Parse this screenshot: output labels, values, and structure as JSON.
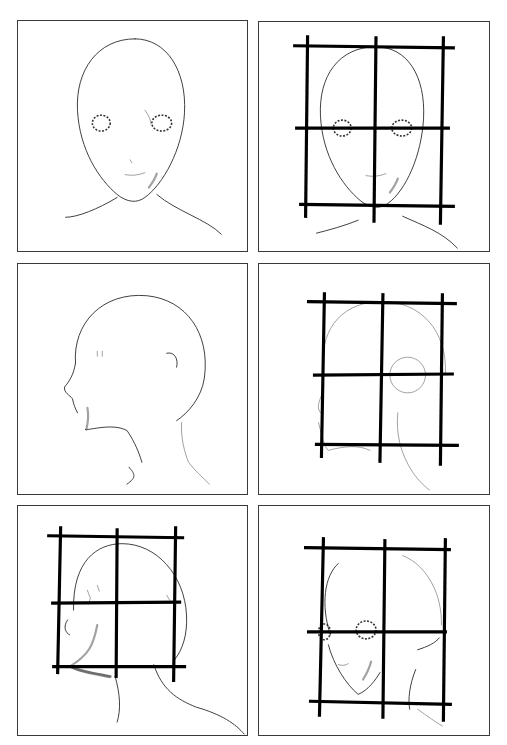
{
  "panels": [
    {
      "id": "front-view",
      "view": "front",
      "grid": false,
      "position": "row1-left"
    },
    {
      "id": "front-view-grid",
      "view": "front",
      "grid": true,
      "grid_lines": {
        "vertical": 3,
        "horizontal": 3
      },
      "position": "row1-right"
    },
    {
      "id": "side-view",
      "view": "profile",
      "grid": false,
      "position": "row2-left"
    },
    {
      "id": "side-view-grid",
      "view": "profile",
      "grid": true,
      "grid_lines": {
        "vertical": 3,
        "horizontal": 3
      },
      "position": "row2-right"
    },
    {
      "id": "side-view-grid-shaded",
      "view": "profile-rear",
      "grid": true,
      "grid_lines": {
        "vertical": 3,
        "horizontal": 3
      },
      "position": "row3-left"
    },
    {
      "id": "three-quarter-view-grid",
      "view": "three-quarter",
      "grid": true,
      "grid_lines": {
        "vertical": 3,
        "horizontal": 3
      },
      "position": "row3-right"
    }
  ],
  "colors": {
    "background": "#ffffff",
    "frame": "#3a3a3a",
    "grid": "#000000",
    "sketch": "#2a2a2a"
  }
}
